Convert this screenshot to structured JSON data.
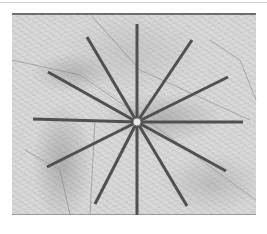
{
  "map": {
    "style": "grayscale shaded-relief topographic map",
    "colors": {
      "background": "#d8d8d8",
      "spoke": "#505050",
      "road": "#8a8a8a",
      "center_marker": "#e8e8e8",
      "frame_top": "#6e6e6e"
    },
    "center": {
      "x": 137,
      "y": 122
    },
    "spokes": [
      {
        "angle_label": "N",
        "x2": 137,
        "y2": 24
      },
      {
        "angle_label": "NNE",
        "x2": 192,
        "y2": 40
      },
      {
        "angle_label": "ENE",
        "x2": 228,
        "y2": 77
      },
      {
        "angle_label": "E",
        "x2": 243,
        "y2": 122
      },
      {
        "angle_label": "ESE",
        "x2": 226,
        "y2": 171
      },
      {
        "angle_label": "SSE",
        "x2": 187,
        "y2": 206
      },
      {
        "angle_label": "S",
        "x2": 137,
        "y2": 215
      },
      {
        "angle_label": "SSW",
        "x2": 95,
        "y2": 204
      },
      {
        "angle_label": "WSW",
        "x2": 47,
        "y2": 167
      },
      {
        "angle_label": "W",
        "x2": 33,
        "y2": 119
      },
      {
        "angle_label": "WNW",
        "x2": 48,
        "y2": 72
      },
      {
        "angle_label": "NNW",
        "x2": 87,
        "y2": 37
      }
    ]
  }
}
